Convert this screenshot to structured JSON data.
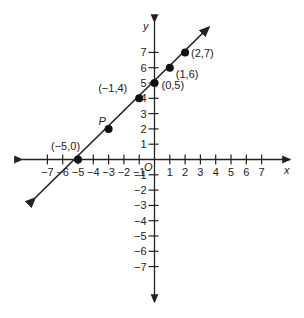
{
  "diagram": {
    "type": "coordinate-plane-line",
    "axes": {
      "x_label": "x",
      "y_label": "y",
      "origin_label": "O",
      "x_ticks": [
        "-7",
        "-6",
        "-5",
        "-4",
        "-3",
        "-2",
        "-1",
        "1",
        "2",
        "3",
        "4",
        "5",
        "6",
        "7"
      ],
      "y_ticks": [
        "7",
        "6",
        "5",
        "4",
        "3",
        "2",
        "1",
        "-1",
        "-2",
        "-3",
        "-4",
        "-5",
        "-6",
        "-7"
      ]
    },
    "points": [
      {
        "label": "(-5,0)",
        "x": -5,
        "y": 0
      },
      {
        "label": "P",
        "x": -3,
        "y": 2
      },
      {
        "label": "(-1,4)",
        "x": -1,
        "y": 4
      },
      {
        "label": "(0,5)",
        "x": 0,
        "y": 5
      },
      {
        "label": "(1,6)",
        "x": 1,
        "y": 6
      },
      {
        "label": "(2,7)",
        "x": 2,
        "y": 7
      }
    ],
    "line": {
      "equation": "y = x + 5",
      "color": "#222222"
    }
  }
}
